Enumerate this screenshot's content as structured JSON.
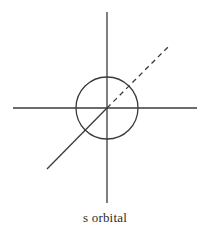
{
  "figure": {
    "kind": "orbital-diagram",
    "caption": "s orbital",
    "width": 210,
    "height": 241,
    "background_color": "#ffffff",
    "stroke_color": "#3a3a3a"
  },
  "chart_data": {
    "type": "diagram",
    "title": "s orbital",
    "xlabel": "",
    "ylabel": "",
    "grid": false,
    "legend": "none",
    "origin": {
      "x": 107,
      "y": 108
    },
    "elements": [
      {
        "name": "horizontal-axis",
        "role": "axis",
        "style": "solid",
        "color": "#3a3a3a",
        "width": 1.3,
        "x1": 13,
        "y1": 108,
        "x2": 197,
        "y2": 108
      },
      {
        "name": "vertical-axis",
        "role": "axis",
        "style": "solid",
        "color": "#3a3a3a",
        "width": 1.3,
        "x1": 107,
        "y1": 12,
        "x2": 107,
        "y2": 203
      },
      {
        "name": "orbital-boundary-circle",
        "role": "orbital-boundary",
        "shape": "circle",
        "style": "solid",
        "color": "#3a3a3a",
        "width": 1.3,
        "cx": 107,
        "cy": 108,
        "r": 31
      },
      {
        "name": "depth-axis-front",
        "role": "axis",
        "style": "solid",
        "color": "#3a3a3a",
        "width": 1.3,
        "x1": 47,
        "y1": 169,
        "x2": 107,
        "y2": 108
      },
      {
        "name": "depth-axis-back",
        "role": "axis",
        "style": "dashed",
        "dash_pattern": "5,4",
        "color": "#3a3a3a",
        "width": 1.3,
        "x1": 107,
        "y1": 108,
        "x2": 170,
        "y2": 45
      }
    ],
    "annotations": [
      {
        "name": "caption",
        "text": "s orbital",
        "x": 107,
        "y": 222
      }
    ]
  }
}
